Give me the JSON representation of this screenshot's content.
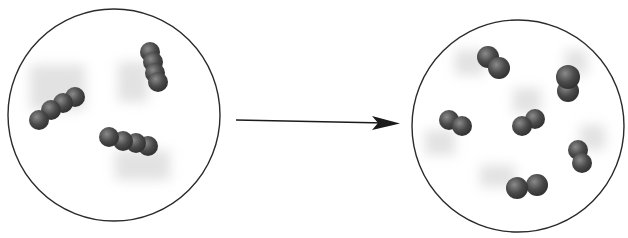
{
  "diagram": {
    "colors": {
      "atom": "#4a4a4a",
      "atom_highlight": "#8a8a8a",
      "outline": "#2a2a2a",
      "motion_blur": "#d0d0d0"
    },
    "left_container": {
      "label": "reactants",
      "molecules": [
        {
          "atoms": 4,
          "orientation": "diagonal-up-right"
        },
        {
          "atoms": 4,
          "orientation": "vertical"
        },
        {
          "atoms": 4,
          "orientation": "horizontal"
        }
      ]
    },
    "arrow": {
      "direction": "right"
    },
    "right_container": {
      "label": "products",
      "molecules": [
        {
          "atoms": 2
        },
        {
          "atoms": 2
        },
        {
          "atoms": 2
        },
        {
          "atoms": 2
        },
        {
          "atoms": 2
        },
        {
          "atoms": 2
        }
      ]
    }
  }
}
